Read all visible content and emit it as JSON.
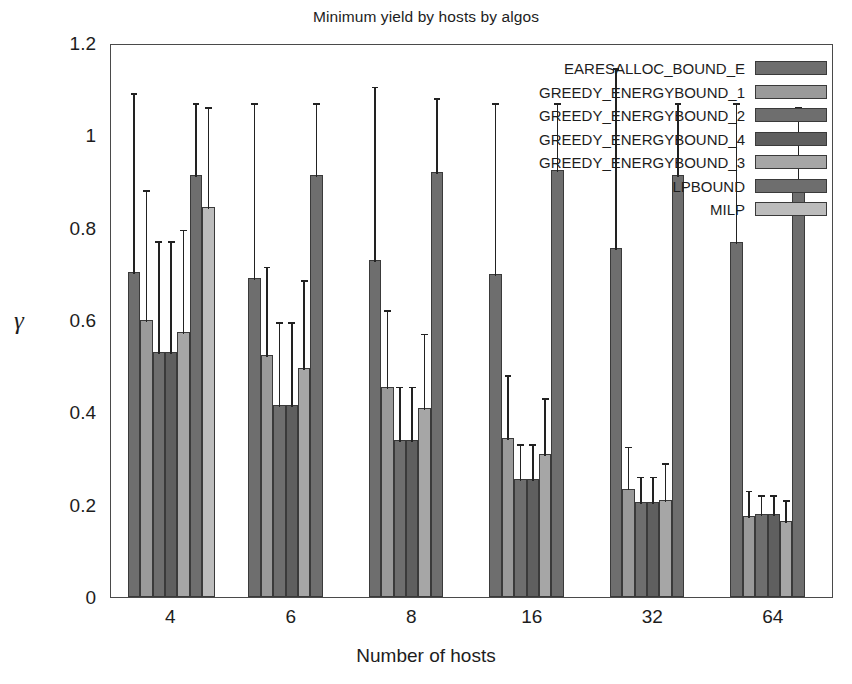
{
  "chart_data": {
    "type": "bar",
    "title": "Minimum yield by hosts by algos",
    "xlabel": "Number of hosts",
    "ylabel": "γ",
    "categories": [
      "4",
      "6",
      "8",
      "16",
      "32",
      "64"
    ],
    "ylim": [
      0,
      1.2
    ],
    "ytick_labels": [
      "0",
      "0.2",
      "0.4",
      "0.6",
      "0.8",
      "1",
      "1.2"
    ],
    "ytick_values": [
      0,
      0.2,
      0.4,
      0.6,
      0.8,
      1.0,
      1.2
    ],
    "grid": false,
    "legend_position": "upper-right-inside",
    "error_bars": "upper-only",
    "series": [
      {
        "name": "EARESALLOC_BOUND_E",
        "color": "#6e6e6e",
        "values": [
          0.705,
          0.69,
          0.73,
          0.7,
          0.755,
          0.77
        ],
        "err_high": [
          1.095,
          1.075,
          1.11,
          1.075,
          1.15,
          1.075
        ]
      },
      {
        "name": "GREEDY_ENERGYBOUND_1",
        "color": "#9a9a9a",
        "values": [
          0.6,
          0.525,
          0.455,
          0.345,
          0.235,
          0.175
        ],
        "err_high": [
          0.885,
          0.72,
          0.625,
          0.485,
          0.33,
          0.235
        ]
      },
      {
        "name": "GREEDY_ENERGYBOUND_2",
        "color": "#6e6e6e",
        "values": [
          0.53,
          0.415,
          0.34,
          0.255,
          0.205,
          0.18
        ],
        "err_high": [
          0.775,
          0.6,
          0.46,
          0.335,
          0.265,
          0.225
        ]
      },
      {
        "name": "GREEDY_ENERGYBOUND_4",
        "color": "#5f5f5f",
        "values": [
          0.53,
          0.415,
          0.34,
          0.255,
          0.205,
          0.18
        ],
        "err_high": [
          0.775,
          0.6,
          0.46,
          0.335,
          0.265,
          0.225
        ]
      },
      {
        "name": "GREEDY_ENERGYBOUND_3",
        "color": "#a6a6a6",
        "values": [
          0.575,
          0.495,
          0.41,
          0.31,
          0.21,
          0.165
        ],
        "err_high": [
          0.8,
          0.69,
          0.575,
          0.435,
          0.295,
          0.215
        ]
      },
      {
        "name": "LPBOUND",
        "color": "#6e6e6e",
        "values": [
          0.915,
          0.915,
          0.92,
          0.925,
          0.915,
          0.905
        ],
        "err_high": [
          1.075,
          1.075,
          1.085,
          1.075,
          1.075,
          1.065
        ]
      },
      {
        "name": "MILP",
        "color": "#bcbcbc",
        "values": [
          0.845,
          null,
          null,
          null,
          null,
          null
        ],
        "err_high": [
          1.065,
          null,
          null,
          null,
          null,
          null
        ]
      }
    ]
  }
}
